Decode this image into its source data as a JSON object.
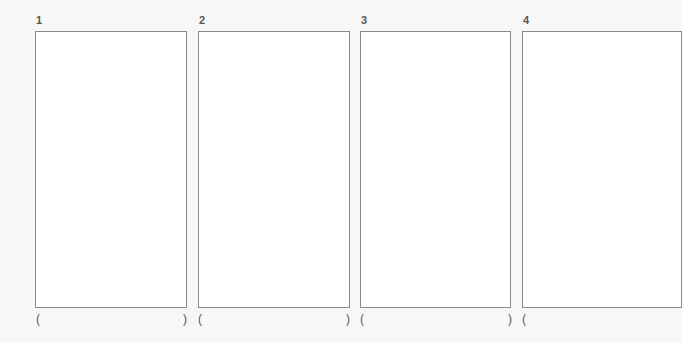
{
  "panels": [
    {
      "number": "1",
      "open_paren": "(",
      "close_paren": ")"
    },
    {
      "number": "2",
      "open_paren": "(",
      "close_paren": ")"
    },
    {
      "number": "3",
      "open_paren": "(",
      "close_paren": ")"
    },
    {
      "number": "4",
      "open_paren": "(",
      "close_paren": ""
    }
  ]
}
